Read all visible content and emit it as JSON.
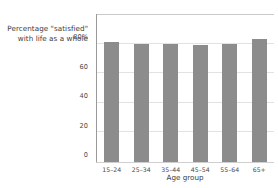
{
  "chart_data": {
    "type": "bar",
    "title": "Percentage \"satisfied\" with life as a whole",
    "title_lines": [
      "Percentage \"satisfied\"",
      "with life as a whole"
    ],
    "categories": [
      "15–24",
      "25–34",
      "35–44",
      "45–54",
      "55–64",
      "65+"
    ],
    "values": [
      81,
      79.5,
      79.5,
      79,
      79.5,
      83
    ],
    "series": [
      {
        "name": "Percentage satisfied with life as a whole",
        "values": [
          81,
          79.5,
          79.5,
          79,
          79.5,
          83
        ]
      }
    ],
    "xlabel": "Age group",
    "ylabel": "",
    "ylim": [
      0,
      100
    ],
    "xlim": [
      0,
      6
    ],
    "yticks": [
      0,
      20,
      40,
      60,
      80
    ],
    "ytick_labels": [
      "0",
      "20",
      "40",
      "60",
      "80%"
    ],
    "grid": true,
    "grid_axis": "y",
    "legend": false,
    "legend_position": "none",
    "bar_color": "#8c8c8c",
    "grid_color": "#e2e2e2",
    "axis_color": "#9a9a9a",
    "background": "#ffffff",
    "text_color": "#3c3c3c"
  }
}
